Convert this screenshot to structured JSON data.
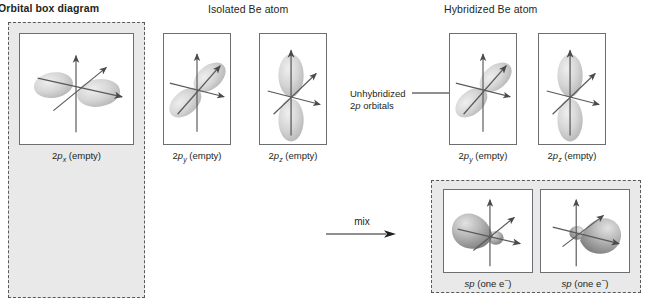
{
  "headers": {
    "orbital_box_diagram": "Orbital box diagram",
    "isolated_atom": "Isolated Be atom",
    "hybridized_atom": "Hybridized Be atom"
  },
  "annotation": {
    "line1": "Unhybridized",
    "line2_prefix": "2",
    "line2_italic": "p",
    "line2_suffix": " orbitals"
  },
  "process": {
    "mix_label": "mix"
  },
  "orbitals": {
    "isolated": [
      {
        "id": "2px",
        "number": "2",
        "letter": "p",
        "subscript": "x",
        "state": " (empty)",
        "axis": "x",
        "caption_plain": "2px (empty)"
      },
      {
        "id": "2py",
        "number": "2",
        "letter": "p",
        "subscript": "y",
        "state": " (empty)",
        "axis": "y",
        "caption_plain": "2py (empty)"
      },
      {
        "id": "2pz",
        "number": "2",
        "letter": "p",
        "subscript": "z",
        "state": " (empty)",
        "axis": "z",
        "caption_plain": "2pz (empty)"
      }
    ],
    "hybridized_unhybridized": [
      {
        "id": "2py-hyb",
        "number": "2",
        "letter": "p",
        "subscript": "y",
        "state": " (empty)",
        "axis": "y",
        "caption_plain": "2py (empty)"
      },
      {
        "id": "2pz-hyb",
        "number": "2",
        "letter": "p",
        "subscript": "z",
        "state": " (empty)",
        "axis": "z",
        "caption_plain": "2pz (empty)"
      }
    ],
    "sp_hybrids": [
      {
        "id": "sp-left",
        "letter": "sp",
        "state": " (one e",
        "charge": "−",
        "close": ")",
        "direction": "left",
        "caption_plain": "sp (one e−)"
      },
      {
        "id": "sp-right",
        "letter": "sp",
        "state": " (one e",
        "charge": "−",
        "close": ")",
        "direction": "right",
        "caption_plain": "sp (one e−)"
      }
    ]
  },
  "colors": {
    "shaded_panel": "#e9e9e9",
    "dashed_border": "#58595b",
    "panel_border": "#6d6e71",
    "axis_line": "#58595b",
    "lobe_light": "#d9d9d9",
    "lobe_mid": "#b5b5b5",
    "lobe_dark": "#8a8a8a",
    "text": "#231f20"
  }
}
